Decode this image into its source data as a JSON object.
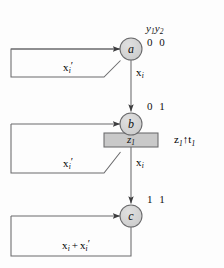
{
  "figure": {
    "type": "state-transition-diagram",
    "background_color": "#fdfdfd",
    "line_color": "#58585a",
    "node_fill": "#d2d2d2",
    "box_fill": "#c9c9c9",
    "text_color": "#111111"
  },
  "header": {
    "variables_label": "y",
    "variables_sub1": "1",
    "variables_label2": "y",
    "variables_sub2": "2"
  },
  "nodes": [
    {
      "id": "a",
      "label": "a",
      "state_code": "0 0",
      "cx": 131,
      "cy": 49,
      "r": 11
    },
    {
      "id": "b",
      "label": "b",
      "state_code": "0 1",
      "cx": 131,
      "cy": 124,
      "r": 11
    },
    {
      "id": "c",
      "label": "c",
      "state_code": "1 1",
      "cx": 131,
      "cy": 216,
      "r": 11
    }
  ],
  "output_box": {
    "label": "z",
    "label_sub": "1",
    "x": 104,
    "y": 133,
    "width": 54,
    "height": 14
  },
  "output_annotation": {
    "signal": "z",
    "signal_sub": "1",
    "arrow": "↑",
    "timing": "t",
    "timing_sub": "1"
  },
  "edges": [
    {
      "from": "a",
      "to": "a",
      "kind": "self-loop",
      "label_var": "x",
      "label_sub": "i",
      "label_prime": "′"
    },
    {
      "from": "a",
      "to": "b",
      "kind": "down-arrow",
      "label_var": "x",
      "label_sub": "i",
      "label_prime": ""
    },
    {
      "from": "b",
      "to": "b",
      "kind": "self-loop",
      "label_var": "x",
      "label_sub": "i",
      "label_prime": "′"
    },
    {
      "from": "b",
      "to": "c",
      "kind": "down-arrow",
      "label_var": "x",
      "label_sub": "i",
      "label_prime": ""
    },
    {
      "from": "c",
      "to": "c",
      "kind": "self-loop",
      "label_sum_first": "x",
      "label_sum_first_sub": "i",
      "label_plus": "+",
      "label_sum_second": "x",
      "label_sum_second_sub": "i",
      "label_sum_second_prime": "′"
    }
  ],
  "labels": {
    "x_var": "x",
    "x_sub": "i",
    "prime": "′",
    "plus": "+",
    "y_var": "y",
    "z_var": "z",
    "t_var": "t",
    "sub_1": "1",
    "sub_2": "2",
    "state_a": "0 0",
    "state_b": "0 1",
    "state_c": "1 1",
    "node_a": "a",
    "node_b": "b",
    "node_c": "c",
    "up_arrow": "↑"
  }
}
